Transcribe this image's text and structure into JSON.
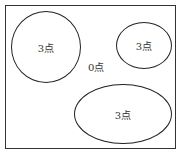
{
  "diagram": {
    "regions": [
      {
        "id": "left-circle",
        "label": "3点"
      },
      {
        "id": "top-right-ellipse",
        "label": "3点"
      },
      {
        "id": "bottom-ellipse",
        "label": "3点"
      }
    ],
    "outside_label": "0点"
  }
}
